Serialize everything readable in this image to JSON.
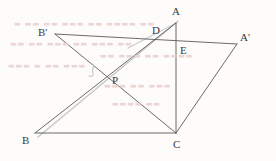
{
  "figure": {
    "canvas": {
      "width": 276,
      "height": 161,
      "background": "#fdfcfa"
    },
    "stroke_color": "#5a5a5a",
    "faint_stroke_color": "#bdbdbd",
    "label_color": "#3a3a3a",
    "watermark_color": "#e8cfcf"
  },
  "points": [
    {
      "id": "A",
      "label": "A",
      "x": 176,
      "y": 23,
      "label_x": 172,
      "label_y": 6
    },
    {
      "id": "Bprime",
      "label": "B'",
      "x": 55,
      "y": 34,
      "label_x": 38,
      "label_y": 27
    },
    {
      "id": "Aprime",
      "label": "A'",
      "x": 237,
      "y": 44,
      "label_x": 240,
      "label_y": 32
    },
    {
      "id": "B",
      "label": "B",
      "x": 35,
      "y": 133,
      "label_x": 22,
      "label_y": 135
    },
    {
      "id": "C",
      "label": "C",
      "x": 176,
      "y": 133,
      "label_x": 173,
      "label_y": 139
    },
    {
      "id": "D",
      "label": "D",
      "x": 160,
      "y": 37,
      "label_x": 152,
      "label_y": 25
    },
    {
      "id": "E",
      "label": "E",
      "x": 176,
      "y": 44,
      "label_x": 180,
      "label_y": 45
    },
    {
      "id": "P",
      "label": "P",
      "x": 107,
      "y": 82,
      "label_x": 112,
      "label_y": 75
    }
  ],
  "segments": [
    {
      "id": "Bprime-Aprime",
      "from": "B'",
      "to": "A'",
      "x1": 55,
      "y1": 34,
      "x2": 237,
      "y2": 44,
      "style": "solid"
    },
    {
      "id": "Bprime-C",
      "from": "B'",
      "to": "C",
      "x1": 55,
      "y1": 34,
      "x2": 176,
      "y2": 133,
      "style": "solid"
    },
    {
      "id": "B-A",
      "from": "B",
      "to": "A",
      "x1": 35,
      "y1": 133,
      "x2": 176,
      "y2": 23,
      "style": "solid"
    },
    {
      "id": "B-C",
      "from": "B",
      "to": "C",
      "x1": 35,
      "y1": 133,
      "x2": 176,
      "y2": 133,
      "style": "solid"
    },
    {
      "id": "A-C",
      "from": "A",
      "to": "C",
      "x1": 176,
      "y1": 23,
      "x2": 176,
      "y2": 133,
      "style": "solid"
    },
    {
      "id": "Aprime-C",
      "from": "A'",
      "to": "C",
      "x1": 237,
      "y1": 44,
      "x2": 176,
      "y2": 133,
      "style": "solid"
    }
  ],
  "faint_segments": [
    {
      "id": "faint-B-A-shadow",
      "x1": 38,
      "y1": 137,
      "x2": 178,
      "y2": 21,
      "note": "light duplicate of B-A"
    },
    {
      "id": "faint-D-sweep",
      "x1": 128,
      "y1": 48,
      "x2": 176,
      "y2": 23,
      "note": "light arc/line through D"
    }
  ],
  "marks": [
    {
      "id": "stray-mark-near-P",
      "x": 92,
      "y": 66,
      "glyph": "刀",
      "note": "faint pen stroke left of P"
    }
  ],
  "watermarks": [
    {
      "id": "wm-row-1",
      "text": "▬ ▬▬ ▬▬ ▬▬▬ ▬▬ ▬▬▬▬  ▬▬",
      "x": 14,
      "y": 20
    },
    {
      "id": "wm-row-2",
      "text": "▬▬ ▬▬ ▬▬▬  ▬▬ ▬▬▬ ▬▬",
      "x": 10,
      "y": 40
    },
    {
      "id": "wm-row-3",
      "text": "▬▬▬ ▬ ▬▬  ▬▬▬",
      "x": 8,
      "y": 62
    },
    {
      "id": "wm-row-4",
      "text": "▬▬ ▬▬▬ ▬▬  ▬▬▬▬",
      "x": 100,
      "y": 52
    },
    {
      "id": "wm-row-5",
      "text": "▬▬▬ ▬▬  ▬▬▬",
      "x": 104,
      "y": 82
    },
    {
      "id": "wm-row-6",
      "text": "▬▬▬▬ ▬▬",
      "x": 112,
      "y": 100
    }
  ]
}
